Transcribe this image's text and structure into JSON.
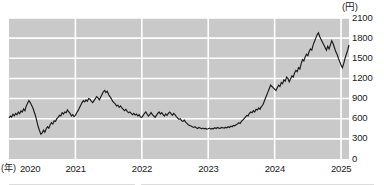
{
  "chart_data": {
    "type": "line",
    "title": "",
    "subtitle": "",
    "xlabel": "(年)",
    "ylabel": "(円)",
    "ylim": [
      0,
      2100
    ],
    "xlim": [
      2020.0,
      2025.12
    ],
    "grid": true,
    "legend_position": "none",
    "y_ticks": [
      0,
      300,
      600,
      900,
      1200,
      1500,
      1800,
      2100
    ],
    "y_tick_labels": [
      "0",
      "300",
      "600",
      "900",
      "1200",
      "1500",
      "1800",
      "2100"
    ],
    "x_ticks": [
      2020,
      2021,
      2022,
      2023,
      2024,
      2025
    ],
    "x_tick_labels": [
      "2020",
      "2021",
      "2022",
      "2023",
      "2024",
      "2025"
    ],
    "colors": {
      "plot_background": "#c9c9c9",
      "gridline": "#ffffff",
      "line": "#1a1a1a",
      "page_background": "#ffffff",
      "text": "#1a1a1a"
    },
    "series": [
      {
        "name": "株価",
        "x": [
          2020.0,
          2020.02,
          2020.04,
          2020.06,
          2020.08,
          2020.1,
          2020.12,
          2020.14,
          2020.16,
          2020.18,
          2020.2,
          2020.22,
          2020.24,
          2020.26,
          2020.28,
          2020.3,
          2020.32,
          2020.34,
          2020.36,
          2020.38,
          2020.4,
          2020.42,
          2020.44,
          2020.46,
          2020.48,
          2020.5,
          2020.52,
          2020.54,
          2020.56,
          2020.58,
          2020.6,
          2020.62,
          2020.64,
          2020.66,
          2020.68,
          2020.7,
          2020.72,
          2020.74,
          2020.76,
          2020.78,
          2020.8,
          2020.82,
          2020.84,
          2020.86,
          2020.88,
          2020.9,
          2020.92,
          2020.94,
          2020.96,
          2020.98,
          2021.0,
          2021.02,
          2021.04,
          2021.06,
          2021.08,
          2021.1,
          2021.12,
          2021.14,
          2021.16,
          2021.18,
          2021.2,
          2021.22,
          2021.24,
          2021.26,
          2021.28,
          2021.3,
          2021.32,
          2021.34,
          2021.36,
          2021.38,
          2021.4,
          2021.42,
          2021.44,
          2021.46,
          2021.48,
          2021.5,
          2021.52,
          2021.54,
          2021.56,
          2021.58,
          2021.6,
          2021.62,
          2021.64,
          2021.66,
          2021.68,
          2021.7,
          2021.72,
          2021.74,
          2021.76,
          2021.78,
          2021.8,
          2021.82,
          2021.84,
          2021.86,
          2021.88,
          2021.9,
          2021.92,
          2021.94,
          2021.96,
          2021.98,
          2022.0,
          2022.02,
          2022.04,
          2022.06,
          2022.08,
          2022.1,
          2022.12,
          2022.14,
          2022.16,
          2022.18,
          2022.2,
          2022.22,
          2022.24,
          2022.26,
          2022.28,
          2022.3,
          2022.32,
          2022.34,
          2022.36,
          2022.38,
          2022.4,
          2022.42,
          2022.44,
          2022.46,
          2022.48,
          2022.5,
          2022.52,
          2022.54,
          2022.56,
          2022.58,
          2022.6,
          2022.62,
          2022.64,
          2022.66,
          2022.68,
          2022.7,
          2022.72,
          2022.74,
          2022.76,
          2022.78,
          2022.8,
          2022.82,
          2022.84,
          2022.86,
          2022.88,
          2022.9,
          2022.92,
          2022.94,
          2022.96,
          2022.98,
          2023.0,
          2023.02,
          2023.04,
          2023.06,
          2023.08,
          2023.1,
          2023.12,
          2023.14,
          2023.16,
          2023.18,
          2023.2,
          2023.22,
          2023.24,
          2023.26,
          2023.28,
          2023.3,
          2023.32,
          2023.34,
          2023.36,
          2023.38,
          2023.4,
          2023.42,
          2023.44,
          2023.46,
          2023.48,
          2023.5,
          2023.52,
          2023.54,
          2023.56,
          2023.58,
          2023.6,
          2023.62,
          2023.64,
          2023.66,
          2023.68,
          2023.7,
          2023.72,
          2023.74,
          2023.76,
          2023.78,
          2023.8,
          2023.82,
          2023.84,
          2023.86,
          2023.88,
          2023.9,
          2023.92,
          2023.94,
          2023.96,
          2023.98,
          2024.0,
          2024.02,
          2024.04,
          2024.06,
          2024.08,
          2024.1,
          2024.12,
          2024.14,
          2024.16,
          2024.18,
          2024.2,
          2024.22,
          2024.24,
          2024.26,
          2024.28,
          2024.3,
          2024.32,
          2024.34,
          2024.36,
          2024.38,
          2024.4,
          2024.42,
          2024.44,
          2024.46,
          2024.48,
          2024.5,
          2024.52,
          2024.54,
          2024.56,
          2024.58,
          2024.6,
          2024.62,
          2024.64,
          2024.66,
          2024.68,
          2024.7,
          2024.72,
          2024.74,
          2024.76,
          2024.78,
          2024.8,
          2024.82,
          2024.84,
          2024.86,
          2024.88,
          2024.9,
          2024.92,
          2024.94,
          2024.96,
          2024.98,
          2025.0,
          2025.02,
          2025.04,
          2025.06,
          2025.08,
          2025.1,
          2025.12
        ],
        "values": [
          610,
          640,
          625,
          665,
          645,
          680,
          660,
          700,
          675,
          715,
          700,
          745,
          720,
          790,
          830,
          870,
          840,
          800,
          760,
          700,
          640,
          560,
          480,
          420,
          370,
          390,
          430,
          400,
          450,
          480,
          460,
          510,
          540,
          520,
          570,
          560,
          600,
          620,
          650,
          640,
          690,
          670,
          700,
          690,
          730,
          700,
          680,
          640,
          660,
          630,
          650,
          690,
          720,
          760,
          800,
          840,
          870,
          850,
          880,
          860,
          900,
          890,
          860,
          840,
          870,
          900,
          930,
          910,
          880,
          920,
          960,
          1000,
          1020,
          990,
          1010,
          960,
          930,
          900,
          860,
          840,
          820,
          790,
          800,
          770,
          790,
          760,
          740,
          720,
          740,
          710,
          690,
          700,
          680,
          660,
          680,
          655,
          670,
          640,
          660,
          625,
          620,
          650,
          680,
          700,
          670,
          640,
          660,
          690,
          660,
          640,
          620,
          650,
          680,
          700,
          670,
          690,
          660,
          640,
          670,
          650,
          680,
          700,
          675,
          650,
          680,
          660,
          630,
          610,
          590,
          600,
          570,
          560,
          580,
          550,
          530,
          510,
          500,
          490,
          480,
          470,
          480,
          465,
          455,
          470,
          460,
          450,
          460,
          450,
          455,
          445,
          450,
          460,
          445,
          455,
          450,
          465,
          455,
          470,
          460,
          455,
          470,
          465,
          460,
          470,
          465,
          480,
          470,
          490,
          480,
          500,
          495,
          510,
          520,
          540,
          530,
          560,
          580,
          600,
          625,
          650,
          640,
          680,
          700,
          690,
          720,
          700,
          740,
          730,
          760,
          740,
          780,
          800,
          850,
          900,
          950,
          1000,
          1050,
          1100,
          1080,
          1060,
          1040,
          1020,
          1060,
          1100,
          1080,
          1140,
          1120,
          1180,
          1160,
          1220,
          1200,
          1150,
          1190,
          1240,
          1220,
          1280,
          1320,
          1300,
          1360,
          1340,
          1420,
          1480,
          1460,
          1520,
          1560,
          1540,
          1600,
          1640,
          1620,
          1700,
          1750,
          1800,
          1850,
          1880,
          1820,
          1780,
          1740,
          1700,
          1660,
          1620,
          1680,
          1640,
          1700,
          1760,
          1720,
          1660,
          1600,
          1560,
          1500,
          1450,
          1400,
          1360,
          1420,
          1500,
          1560,
          1620,
          1700
        ]
      }
    ],
    "annotations": [
      {
        "text": "2020年3月の安値",
        "approx_value": 370
      },
      {
        "text": "2024年の高値",
        "approx_value": 1880
      }
    ]
  },
  "axes": {
    "unit_label": "(円)",
    "x_unit_label": "(年)"
  }
}
